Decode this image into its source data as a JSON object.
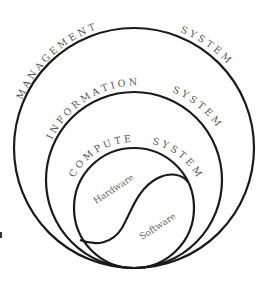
{
  "diagram": {
    "colors": {
      "stroke": "#1a1a1a",
      "label": "#555555",
      "background": "#ffffff"
    },
    "rings": [
      {
        "id": "management",
        "label_first": "M A N A G E M E N T",
        "label_second": "S Y S T E M",
        "cx": 134,
        "cy": 148,
        "r": 120
      },
      {
        "id": "information",
        "label_first": "I N F O R M A T I O N",
        "label_second": "S Y S T E M",
        "cx": 134,
        "cy": 180,
        "r": 88
      },
      {
        "id": "computer",
        "label_first": "C O M P U T E R",
        "label_second": "S Y S T E M",
        "cx": 134,
        "cy": 208,
        "r": 60
      }
    ],
    "regions": {
      "hardware": "Hardware",
      "software": "Software"
    }
  }
}
